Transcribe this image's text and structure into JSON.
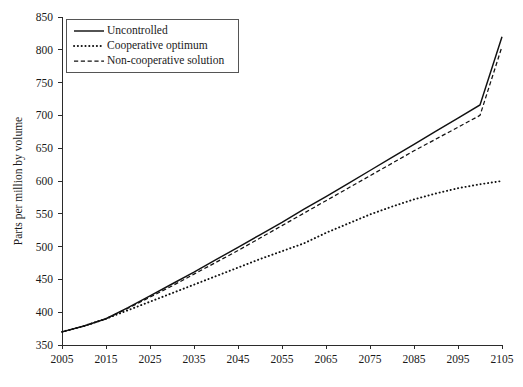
{
  "chart_data": {
    "type": "line",
    "title": "",
    "xlabel": "",
    "ylabel": "Parts per million by volume",
    "xlim": [
      2005,
      2105
    ],
    "ylim": [
      350,
      850
    ],
    "xticks": [
      2005,
      2015,
      2025,
      2035,
      2045,
      2055,
      2065,
      2075,
      2085,
      2095,
      2105
    ],
    "yticks": [
      350,
      400,
      450,
      500,
      550,
      600,
      650,
      700,
      750,
      800,
      850
    ],
    "grid": false,
    "legend_position": "top-left",
    "x": [
      2005,
      2010,
      2015,
      2020,
      2025,
      2030,
      2035,
      2040,
      2045,
      2050,
      2055,
      2060,
      2065,
      2070,
      2075,
      2080,
      2085,
      2090,
      2095,
      2100,
      2105
    ],
    "series": [
      {
        "name": "Uncontrolled",
        "style": "solid",
        "values": [
          370,
          379,
          390,
          407,
          425,
          443,
          461,
          480,
          499,
          518,
          537,
          557,
          576,
          596,
          616,
          636,
          656,
          676,
          696,
          716,
          820
        ]
      },
      {
        "name": "Cooperative optimum",
        "style": "dotted",
        "values": [
          370,
          379,
          390,
          403,
          416,
          429,
          442,
          455,
          468,
          481,
          493,
          505,
          521,
          535,
          549,
          561,
          572,
          581,
          589,
          595,
          600
        ]
      },
      {
        "name": "Non-cooperative solution",
        "style": "dashed",
        "values": [
          370,
          379,
          390,
          406,
          423,
          440,
          458,
          476,
          494,
          513,
          532,
          551,
          570,
          589,
          608,
          627,
          646,
          664,
          682,
          700,
          805
        ]
      }
    ]
  },
  "legend": {
    "items": [
      {
        "label": "Uncontrolled",
        "style": "solid"
      },
      {
        "label": "Cooperative optimum",
        "style": "dotted"
      },
      {
        "label": "Non-cooperative solution",
        "style": "dashed"
      }
    ]
  },
  "colors": {
    "ink": "#111111",
    "axis": "#2b2b2b",
    "background": "#ffffff",
    "legend_border": "#555555"
  }
}
